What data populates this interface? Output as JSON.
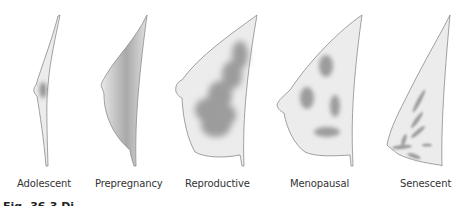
{
  "figure": {
    "stages": [
      {
        "label": "Adolescent",
        "x": 17
      },
      {
        "label": "Prepregnancy",
        "x": 95
      },
      {
        "label": "Reproductive",
        "x": 185
      },
      {
        "label": "Menopausal",
        "x": 290
      },
      {
        "label": "Senescent",
        "x": 400
      }
    ],
    "caption": "Fig. 36.3 Di",
    "colors": {
      "outline": "#8a8a8a",
      "fill": "#ececec",
      "gland": "#9a9a9a"
    }
  }
}
